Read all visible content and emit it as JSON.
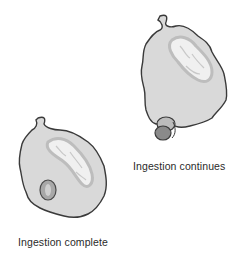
{
  "figure": {
    "panels": [
      {
        "id": "ingestion-continues",
        "caption": "Ingestion continues",
        "description": "Phagocytic cell with nucleus; particle being engulfed at lower edge"
      },
      {
        "id": "ingestion-complete",
        "caption": "Ingestion complete",
        "description": "Phagocytic cell with nucleus; particle enclosed inside a phagosome"
      }
    ],
    "colors": {
      "cytoplasm": "#d9d9d9",
      "cell_outline": "#3a3a3a",
      "nucleus_rim": "#bdbdbd",
      "nucleus_fill": "#f2f2f2",
      "particle": "#8a8a8a",
      "phagosome": "#a8a8a8"
    }
  }
}
